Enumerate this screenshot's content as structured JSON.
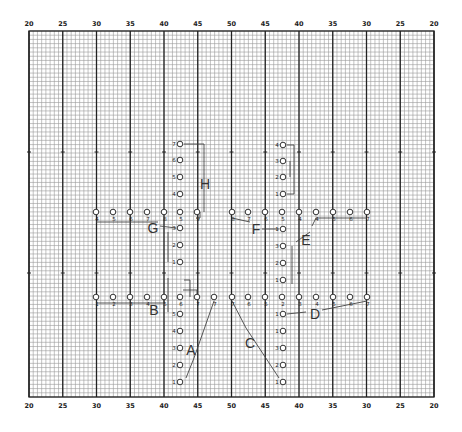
{
  "field": {
    "grid": {
      "x0": 29,
      "y0": 31,
      "x1": 434,
      "y1": 397,
      "minor_step": 4.22,
      "major_step": 33.75
    },
    "yard_labels_top": [
      "20",
      "25",
      "30",
      "35",
      "40",
      "45",
      "50",
      "45",
      "40",
      "35",
      "30",
      "25",
      "20"
    ],
    "yard_labels_bottom": [
      "20",
      "25",
      "30",
      "35",
      "40",
      "45",
      "50",
      "45",
      "40",
      "35",
      "30",
      "25",
      "20"
    ],
    "hash_rows_y": [
      152,
      273
    ],
    "colors": {
      "minor": "#9a9a9a",
      "major": "#222222",
      "marker": "#333333",
      "path": "#444444",
      "background": "#ffffff"
    }
  },
  "chart_data": {
    "type": "diagram",
    "title": "",
    "groups": [
      {
        "name": "A",
        "label_pos": [
          191,
          350
        ],
        "positions": [
          {
            "n": "1",
            "x": 180,
            "y": 382
          },
          {
            "n": "2",
            "x": 180,
            "y": 365
          },
          {
            "n": "3",
            "x": 180,
            "y": 348
          },
          {
            "n": "4",
            "x": 180,
            "y": 331
          },
          {
            "n": "5",
            "x": 180,
            "y": 314
          },
          {
            "n": "7",
            "x": 214,
            "y": 297
          }
        ]
      },
      {
        "name": "B",
        "label_pos": [
          154,
          310
        ],
        "positions": [
          {
            "n": "1",
            "x": 96,
            "y": 297
          },
          {
            "n": "2",
            "x": 113,
            "y": 297
          },
          {
            "n": "3",
            "x": 130,
            "y": 297
          },
          {
            "n": "4",
            "x": 147,
            "y": 297
          },
          {
            "n": "5",
            "x": 164,
            "y": 297
          },
          {
            "n": "6",
            "x": 180,
            "y": 297
          },
          {
            "n": "7",
            "x": 197,
            "y": 297
          }
        ]
      },
      {
        "name": "C",
        "label_pos": [
          250,
          343
        ],
        "positions": [
          {
            "n": "1",
            "x": 283,
            "y": 382
          },
          {
            "n": "2",
            "x": 283,
            "y": 365
          },
          {
            "n": "3",
            "x": 283,
            "y": 348
          },
          {
            "n": "1",
            "x": 283,
            "y": 331
          },
          {
            "n": "5",
            "x": 265,
            "y": 297
          },
          {
            "n": "6",
            "x": 248,
            "y": 297
          },
          {
            "n": "7",
            "x": 232,
            "y": 297
          }
        ]
      },
      {
        "name": "D",
        "label_pos": [
          315,
          314
        ],
        "positions": [
          {
            "n": "1",
            "x": 283,
            "y": 314
          },
          {
            "n": "2",
            "x": 282,
            "y": 297
          },
          {
            "n": "3",
            "x": 299,
            "y": 297
          },
          {
            "n": "4",
            "x": 316,
            "y": 297
          },
          {
            "n": "5",
            "x": 333,
            "y": 297
          },
          {
            "n": "6",
            "x": 350,
            "y": 297
          },
          {
            "n": "7",
            "x": 367,
            "y": 297
          }
        ]
      },
      {
        "name": "E",
        "label_pos": [
          306,
          240
        ],
        "positions": [
          {
            "n": "1",
            "x": 283,
            "y": 280
          },
          {
            "n": "2",
            "x": 283,
            "y": 263
          },
          {
            "n": "3",
            "x": 283,
            "y": 246
          },
          {
            "n": "4",
            "x": 316,
            "y": 212
          },
          {
            "n": "5",
            "x": 333,
            "y": 212
          },
          {
            "n": "6",
            "x": 350,
            "y": 212
          },
          {
            "n": "7",
            "x": 367,
            "y": 212
          }
        ]
      },
      {
        "name": "F",
        "label_pos": [
          256,
          229
        ],
        "positions": [
          {
            "n": "1",
            "x": 283,
            "y": 229
          },
          {
            "n": "4",
            "x": 299,
            "y": 212
          },
          {
            "n": "5",
            "x": 282,
            "y": 212
          },
          {
            "n": "6",
            "x": 265,
            "y": 212
          },
          {
            "n": "7",
            "x": 248,
            "y": 212
          },
          {
            "n": "8",
            "x": 232,
            "y": 212
          }
        ]
      },
      {
        "name": "G",
        "label_pos": [
          153,
          228
        ],
        "positions": [
          {
            "n": "1",
            "x": 180,
            "y": 262
          },
          {
            "n": "2",
            "x": 180,
            "y": 245
          },
          {
            "n": "3",
            "x": 180,
            "y": 228
          },
          {
            "n": "4",
            "x": 96,
            "y": 212
          },
          {
            "n": "5",
            "x": 113,
            "y": 212
          },
          {
            "n": "6",
            "x": 130,
            "y": 212
          },
          {
            "n": "7",
            "x": 147,
            "y": 212
          }
        ]
      },
      {
        "name": "H",
        "label_pos": [
          205,
          184
        ],
        "positions": [
          {
            "n": "4",
            "x": 180,
            "y": 194
          },
          {
            "n": "5",
            "x": 180,
            "y": 177
          },
          {
            "n": "6",
            "x": 180,
            "y": 160
          },
          {
            "n": "7",
            "x": 180,
            "y": 144
          },
          {
            "n": "8",
            "x": 164,
            "y": 212
          },
          {
            "n": "5",
            "x": 180,
            "y": 212
          },
          {
            "n": "9",
            "x": 197,
            "y": 212
          }
        ]
      },
      {
        "name": "top-right",
        "positions": [
          {
            "n": "4",
            "x": 283,
            "y": 145
          },
          {
            "n": "3",
            "x": 283,
            "y": 161
          },
          {
            "n": "2",
            "x": 283,
            "y": 177
          },
          {
            "n": "1",
            "x": 283,
            "y": 194
          }
        ]
      }
    ],
    "rows": {
      "upper_line_y": 212,
      "lower_line_y": 297,
      "xs": [
        96,
        113,
        130,
        147,
        164,
        180,
        197,
        214,
        232,
        248,
        265,
        282,
        299,
        316,
        333,
        350,
        367
      ]
    }
  }
}
